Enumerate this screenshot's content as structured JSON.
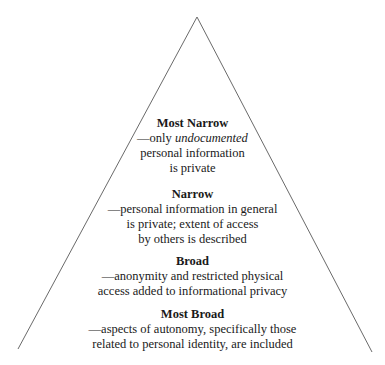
{
  "diagram": {
    "type": "pyramid",
    "shape": {
      "apex": [
        197,
        17
      ],
      "left_base": [
        18,
        349
      ],
      "right_base": [
        372,
        352
      ],
      "stroke_color": "#6a6a6a"
    },
    "levels": [
      {
        "title": "Most Narrow",
        "lines": [
          "—only ",
          "undocumented",
          "personal information",
          "is private"
        ]
      },
      {
        "title": "Narrow",
        "lines": [
          "—personal information in general",
          "is private; extent of access",
          "by others is described"
        ]
      },
      {
        "title": "Broad",
        "lines": [
          "—anonymity and restricted physical",
          "access added to informational privacy"
        ]
      },
      {
        "title": "Most Broad",
        "lines": [
          "—aspects of autonomy, specifically those",
          "related to personal identity, are included"
        ]
      }
    ]
  }
}
